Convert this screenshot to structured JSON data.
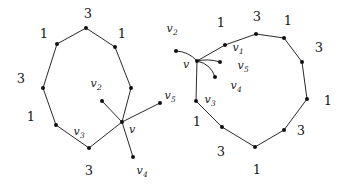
{
  "figure": {
    "width": 341,
    "height": 185,
    "background": "#ffffff",
    "ink_color": "#111111"
  },
  "graphs": [
    {
      "id": "left-graph",
      "name": "left-graph",
      "cycle_nodes": [
        {
          "id": "L0",
          "x": 86,
          "y": 28
        },
        {
          "id": "L1",
          "x": 115,
          "y": 47
        },
        {
          "id": "L2",
          "x": 131,
          "y": 88
        },
        {
          "id": "L3",
          "x": 122,
          "y": 122
        },
        {
          "id": "L4",
          "x": 89,
          "y": 148
        },
        {
          "id": "L5",
          "x": 56,
          "y": 125
        },
        {
          "id": "L6",
          "x": 43,
          "y": 88
        },
        {
          "id": "L7",
          "x": 57,
          "y": 44
        }
      ],
      "extra_nodes": [
        {
          "id": "Lv2",
          "x": 102,
          "y": 101
        },
        {
          "id": "Lv5",
          "x": 160,
          "y": 103
        },
        {
          "id": "Lv4",
          "x": 133,
          "y": 157
        }
      ],
      "edges": [
        {
          "from": "L0",
          "to": "L1"
        },
        {
          "from": "L1",
          "to": "L2"
        },
        {
          "from": "L2",
          "to": "L3"
        },
        {
          "from": "L3",
          "to": "L4"
        },
        {
          "from": "L4",
          "to": "L5"
        },
        {
          "from": "L5",
          "to": "L6"
        },
        {
          "from": "L6",
          "to": "L7"
        },
        {
          "from": "L7",
          "to": "L0"
        },
        {
          "from": "L3",
          "to": "Lv2"
        },
        {
          "from": "L3",
          "to": "Lv5"
        },
        {
          "from": "L3",
          "to": "Lv4"
        }
      ],
      "weight_labels": [
        {
          "text": "3",
          "x": 88,
          "y": 13
        },
        {
          "text": "1",
          "x": 122,
          "y": 33
        },
        {
          "text": "1",
          "x": 44,
          "y": 33
        },
        {
          "text": "3",
          "x": 21,
          "y": 78
        },
        {
          "text": "1",
          "x": 31,
          "y": 116
        },
        {
          "text": "3",
          "x": 89,
          "y": 170
        }
      ],
      "vertex_labels": [
        {
          "base": "v",
          "sub": "2",
          "x": 96,
          "y": 83
        },
        {
          "base": "v",
          "sub": "3",
          "x": 79,
          "y": 131
        },
        {
          "base": "v",
          "sub": "",
          "x": 132,
          "y": 129
        },
        {
          "base": "v",
          "sub": "5",
          "x": 170,
          "y": 95
        },
        {
          "base": "v",
          "sub": "4",
          "x": 142,
          "y": 170
        }
      ]
    },
    {
      "id": "right-graph",
      "name": "right-graph",
      "cycle_nodes": [
        {
          "id": "R0",
          "x": 256,
          "y": 34
        },
        {
          "id": "R1",
          "x": 284,
          "y": 38
        },
        {
          "id": "R2",
          "x": 302,
          "y": 62
        },
        {
          "id": "R3",
          "x": 307,
          "y": 99
        },
        {
          "id": "R4",
          "x": 284,
          "y": 130
        },
        {
          "id": "R5",
          "x": 255,
          "y": 147
        },
        {
          "id": "R6",
          "x": 222,
          "y": 127
        },
        {
          "id": "R7",
          "x": 196,
          "y": 101
        },
        {
          "id": "R8",
          "x": 225,
          "y": 45
        }
      ],
      "center_node": {
        "id": "Rv",
        "x": 197,
        "y": 61
      },
      "extra_nodes": [
        {
          "id": "Rv2",
          "x": 176,
          "y": 51
        },
        {
          "id": "Rv5",
          "x": 220,
          "y": 62
        },
        {
          "id": "Rv4",
          "x": 215,
          "y": 77
        }
      ],
      "edges": [
        {
          "from": "R0",
          "to": "R1"
        },
        {
          "from": "R1",
          "to": "R2"
        },
        {
          "from": "R2",
          "to": "R3"
        },
        {
          "from": "R3",
          "to": "R4"
        },
        {
          "from": "R4",
          "to": "R5"
        },
        {
          "from": "R5",
          "to": "R6"
        },
        {
          "from": "R6",
          "to": "R7"
        },
        {
          "from": "R8",
          "to": "R0"
        }
      ],
      "curved_edges": [
        {
          "from": "Rv",
          "to": "Rv2",
          "curve": "up"
        },
        {
          "from": "Rv",
          "to": "R8",
          "curve": "straight"
        },
        {
          "from": "Rv",
          "to": "Rv5",
          "curve": "slight"
        },
        {
          "from": "Rv",
          "to": "Rv4",
          "curve": "down"
        },
        {
          "from": "Rv",
          "to": "R7",
          "curve": "straight"
        }
      ],
      "weight_labels": [
        {
          "text": "1",
          "x": 221,
          "y": 22
        },
        {
          "text": "3",
          "x": 257,
          "y": 16
        },
        {
          "text": "1",
          "x": 288,
          "y": 20
        },
        {
          "text": "3",
          "x": 319,
          "y": 47
        },
        {
          "text": "1",
          "x": 328,
          "y": 100
        },
        {
          "text": "3",
          "x": 301,
          "y": 130
        },
        {
          "text": "1",
          "x": 257,
          "y": 169
        },
        {
          "text": "3",
          "x": 221,
          "y": 151
        },
        {
          "text": "1",
          "x": 197,
          "y": 121
        }
      ],
      "vertex_labels": [
        {
          "base": "v",
          "sub": "2",
          "x": 172,
          "y": 28
        },
        {
          "base": "v",
          "sub": "1",
          "x": 238,
          "y": 47
        },
        {
          "base": "v",
          "sub": "",
          "x": 186,
          "y": 64
        },
        {
          "base": "v",
          "sub": "5",
          "x": 243,
          "y": 65
        },
        {
          "base": "v",
          "sub": "4",
          "x": 236,
          "y": 85
        },
        {
          "base": "v",
          "sub": "3",
          "x": 210,
          "y": 99
        }
      ]
    }
  ]
}
